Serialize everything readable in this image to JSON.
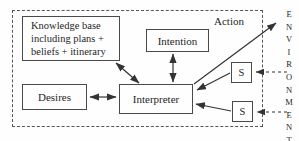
{
  "diagram": {
    "knowledge_base": {
      "line1": "Knowledge base",
      "line2": "including plans +",
      "line3": "beliefs + itinerary"
    },
    "intention_label": "Intention",
    "desires_label": "Desires",
    "interpreter_label": "Interpreter",
    "sensor_top_label": "S",
    "sensor_bottom_label": "S",
    "action_label": "Action",
    "environment_label": "ENVIRONMENT"
  },
  "colors": {
    "line": "#333333",
    "text": "#1f1f1f",
    "background": "#fefefe",
    "box_border": "#4a4a4a"
  }
}
